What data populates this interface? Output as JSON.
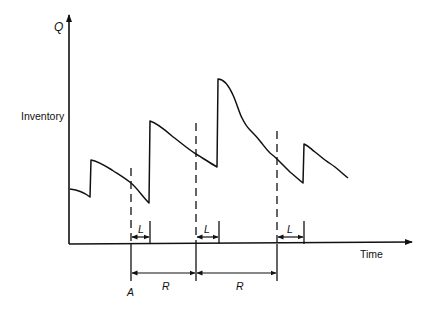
{
  "diagram": {
    "axes": {
      "y_label": "Inventory",
      "y_max_label": "Q",
      "x_label": "Time"
    },
    "annotations": {
      "review_start_label": "A",
      "lead_time_label": "L",
      "review_period_label": "R"
    },
    "colors": {
      "line": "#111111",
      "background": "#ffffff"
    },
    "inventory_curve": [
      [
        70,
        189
      ],
      [
        80,
        192
      ],
      [
        90,
        197
      ],
      [
        91,
        160
      ],
      [
        100,
        163
      ],
      [
        112,
        170
      ],
      [
        122,
        177
      ],
      [
        131,
        183
      ],
      [
        140,
        193
      ],
      [
        149,
        203
      ],
      [
        150,
        121
      ],
      [
        160,
        126
      ],
      [
        172,
        136
      ],
      [
        185,
        146
      ],
      [
        196,
        154
      ],
      [
        207,
        161
      ],
      [
        217,
        167
      ],
      [
        218,
        79
      ],
      [
        225,
        82
      ],
      [
        233,
        95
      ],
      [
        242,
        118
      ],
      [
        250,
        130
      ],
      [
        260,
        141
      ],
      [
        270,
        153
      ],
      [
        278,
        160
      ],
      [
        290,
        172
      ],
      [
        303,
        183
      ],
      [
        304,
        144
      ],
      [
        315,
        152
      ],
      [
        325,
        160
      ],
      [
        335,
        167
      ],
      [
        348,
        178
      ]
    ],
    "review_points_x": [
      131,
      196,
      277
    ],
    "order_arrival_x": [
      150,
      218,
      304
    ]
  }
}
